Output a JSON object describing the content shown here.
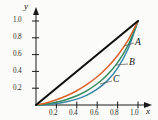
{
  "chart_data": {
    "type": "line",
    "title": "",
    "xlabel": "x",
    "ylabel": "y",
    "xlim": [
      0,
      1.05
    ],
    "ylim": [
      0,
      1.05
    ],
    "grid": false,
    "legend_position": "inline-right",
    "xticks": [
      "0.2",
      "0.4",
      "0.6",
      "0.8",
      "1.0"
    ],
    "xtick_values": [
      0.2,
      0.4,
      0.6,
      0.8,
      1.0
    ],
    "yticks": [
      "0.2",
      "0.4",
      "0.6",
      "0.8",
      "1.0"
    ],
    "ytick_values": [
      0.2,
      0.4,
      0.6,
      0.8,
      1.0
    ],
    "series": [
      {
        "name": "diagonal",
        "label": "",
        "color": "#111111",
        "x": [
          0,
          1.0
        ],
        "values": [
          0,
          1.0
        ]
      },
      {
        "name": "A",
        "label": "A",
        "color": "#d9622b",
        "x": [
          0,
          0.1,
          0.2,
          0.3,
          0.4,
          0.5,
          0.6,
          0.7,
          0.8,
          0.9,
          1.0
        ],
        "values": [
          0,
          0.025,
          0.062,
          0.11,
          0.17,
          0.245,
          0.336,
          0.45,
          0.59,
          0.765,
          1.0
        ]
      },
      {
        "name": "B",
        "label": "B",
        "color": "#2f8b5e",
        "x": [
          0,
          0.1,
          0.2,
          0.3,
          0.4,
          0.5,
          0.6,
          0.7,
          0.8,
          0.9,
          1.0
        ],
        "values": [
          0,
          0.012,
          0.034,
          0.066,
          0.11,
          0.172,
          0.253,
          0.36,
          0.505,
          0.705,
          1.0
        ]
      },
      {
        "name": "C",
        "label": "C",
        "color": "#3a87a8",
        "x": [
          0,
          0.1,
          0.2,
          0.3,
          0.4,
          0.5,
          0.6,
          0.7,
          0.8,
          0.9,
          1.0
        ],
        "values": [
          0,
          0.005,
          0.017,
          0.038,
          0.07,
          0.118,
          0.188,
          0.29,
          0.44,
          0.66,
          1.0
        ]
      }
    ],
    "annotations": [
      {
        "text": "A",
        "x": 0.98,
        "y": 0.63
      },
      {
        "text": "B",
        "x": 0.98,
        "y": 0.4
      },
      {
        "text": "C",
        "x": 0.82,
        "y": 0.22
      }
    ]
  }
}
